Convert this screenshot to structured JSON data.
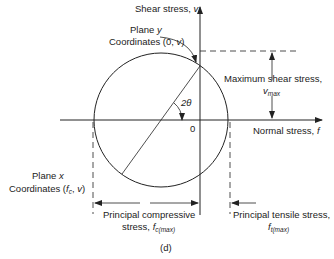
{
  "diagram": {
    "type": "mohr-circle",
    "caption": "(d)",
    "axes": {
      "vertical_label": "Shear stress,",
      "vertical_symbol": "v",
      "horizontal_label": "Normal stress,",
      "horizontal_symbol": "f",
      "origin_label": "0"
    },
    "angle_label": "2θ",
    "plane_y": {
      "title": "Plane",
      "symbol": "y",
      "coords_label": "Coordinates (0,",
      "coords_symbol": "v",
      "coords_close": ")"
    },
    "plane_x": {
      "title": "Plane",
      "symbol": "x",
      "coords_label": "Coordinates (",
      "coords_f": "f",
      "coords_f_sub": "c",
      "coords_mid": ",",
      "coords_symbol": "v",
      "coords_close": ")"
    },
    "max_shear": {
      "label": "Maximum shear stress,",
      "symbol": "v",
      "sub": "max"
    },
    "compressive": {
      "label_line1": "Principal compressive",
      "label_line2": "stress,",
      "symbol": "f",
      "sub": "c(max)"
    },
    "tensile": {
      "label_line1": "Principal tensile stress,",
      "symbol": "f",
      "sub": "t(max)"
    },
    "colors": {
      "line": "#222222",
      "background": "#ffffff"
    }
  }
}
